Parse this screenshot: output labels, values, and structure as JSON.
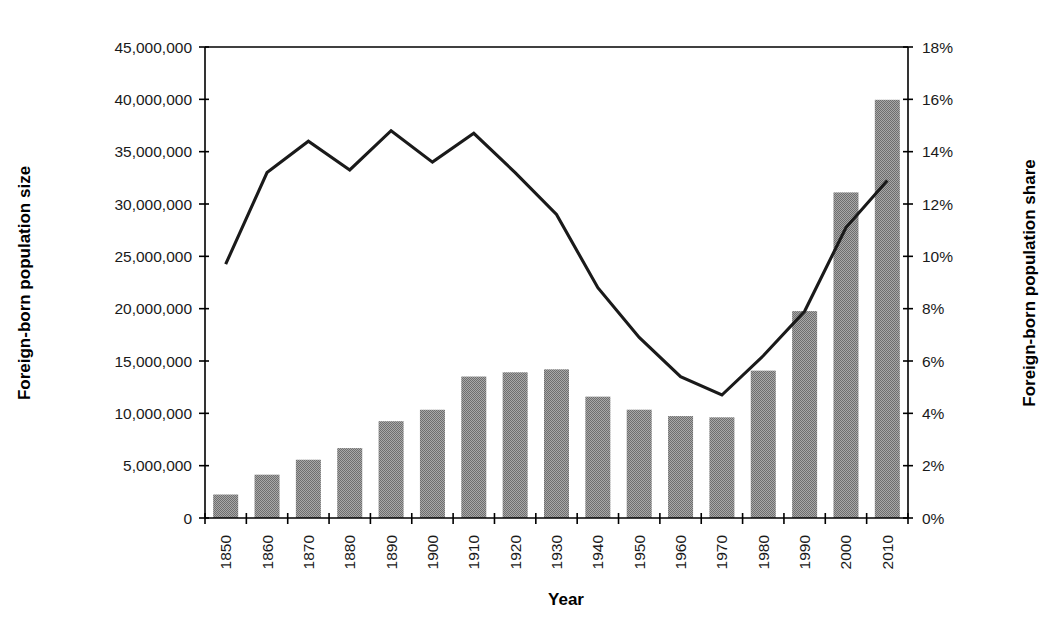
{
  "chart_data": {
    "type": "bar",
    "title": "",
    "xlabel": "Year",
    "ylabel": "Foreign-born population size",
    "y2label": "Foreign-born population share",
    "categories": [
      "1850",
      "1860",
      "1870",
      "1880",
      "1890",
      "1900",
      "1910",
      "1920",
      "1930",
      "1940",
      "1950",
      "1960",
      "1970",
      "1980",
      "1990",
      "2000",
      "2010"
    ],
    "ylim": [
      0,
      45000000
    ],
    "y2lim": [
      0,
      18
    ],
    "ytick_values": [
      0,
      5000000,
      10000000,
      15000000,
      20000000,
      25000000,
      30000000,
      35000000,
      40000000,
      45000000
    ],
    "ytick_labels": [
      "0",
      "5,000,000",
      "10,000,000",
      "15,000,000",
      "20,000,000",
      "25,000,000",
      "30,000,000",
      "35,000,000",
      "40,000,000",
      "45,000,000"
    ],
    "y2tick_values": [
      0,
      2,
      4,
      6,
      8,
      10,
      12,
      14,
      16,
      18
    ],
    "y2tick_labels": [
      "0%",
      "2%",
      "4%",
      "6%",
      "8%",
      "10%",
      "12%",
      "14%",
      "16%",
      "18%"
    ],
    "grid": false,
    "legend": "none",
    "series": [
      {
        "name": "Foreign-born population size",
        "type": "bar",
        "axis": "left",
        "color": "#8c8c8c",
        "values": [
          2244602,
          4138697,
          5567229,
          6679943,
          9249547,
          10341276,
          13515886,
          13920692,
          14204149,
          11594896,
          10347395,
          9738091,
          9619302,
          14079906,
          19767316,
          31107889,
          39955673
        ]
      },
      {
        "name": "Foreign-born population share",
        "type": "line",
        "axis": "right",
        "color": "#1a1a1a",
        "values": [
          9.7,
          13.2,
          14.4,
          13.3,
          14.8,
          13.6,
          14.7,
          13.2,
          11.6,
          8.8,
          6.9,
          5.4,
          4.7,
          6.2,
          7.9,
          11.1,
          12.9
        ]
      }
    ]
  }
}
